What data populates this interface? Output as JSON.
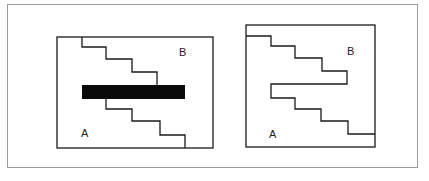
{
  "figure": {
    "left_diagram": {
      "label_top_right": "B",
      "label_bottom_left": "A"
    },
    "right_diagram": {
      "label_top_right": "B",
      "label_bottom_left": "A"
    },
    "colors": {
      "line": "#1a1a1a",
      "bar": "#0a0a0a",
      "frame": "#9a9a9a",
      "background": "#ffffff"
    }
  }
}
